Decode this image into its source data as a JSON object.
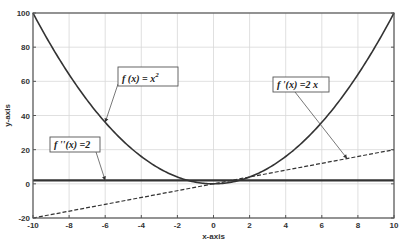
{
  "chart_data": {
    "type": "line",
    "title": "",
    "xlabel": "x-axis",
    "ylabel": "y-axis",
    "xlim": [
      -10,
      10
    ],
    "ylim": [
      -20,
      100
    ],
    "grid": true,
    "xticks": [
      -10,
      -8,
      -6,
      -4,
      -2,
      0,
      2,
      4,
      6,
      8,
      10
    ],
    "yticks": [
      -20,
      0,
      20,
      40,
      60,
      80,
      100
    ],
    "series": [
      {
        "name": "f(x) = x^2",
        "expr": "x^2",
        "style": "solid",
        "color": "#333333",
        "x": [
          -10,
          -8,
          -6,
          -4,
          -2,
          0,
          2,
          4,
          6,
          8,
          10
        ],
        "values": [
          100,
          64,
          36,
          16,
          4,
          0,
          4,
          16,
          36,
          64,
          100
        ]
      },
      {
        "name": "f'(x) = 2x",
        "expr": "2x",
        "style": "dashed",
        "color": "#333333",
        "x": [
          -10,
          10
        ],
        "values": [
          -20,
          20
        ]
      },
      {
        "name": "f''(x) = 2",
        "expr": "2",
        "style": "solid-thick",
        "color": "#333333",
        "x": [
          -10,
          10
        ],
        "values": [
          2,
          2
        ]
      }
    ],
    "annotations": [
      {
        "text_main": "f (x) = x",
        "text_sup": "2",
        "arrow_to": [
          -6,
          36
        ]
      },
      {
        "text_main": "f '(x) =2 x",
        "text_sup": "",
        "arrow_to": [
          7.4,
          14.8
        ]
      },
      {
        "text_main": "f ''(x) =2",
        "text_sup": "",
        "arrow_to": [
          -6,
          2
        ]
      }
    ]
  }
}
